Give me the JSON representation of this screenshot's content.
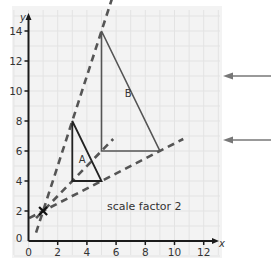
{
  "diagram": {
    "type": "enlargement",
    "caption": "scale factor 2",
    "scale_factor": 2,
    "center_of_enlargement": {
      "x": 1,
      "y": 2,
      "marker": "cross"
    },
    "axes": {
      "x_label": "x",
      "y_label": "y",
      "x_ticks": [
        "0",
        "2",
        "4",
        "6",
        "8",
        "10",
        "12"
      ],
      "y_ticks": [
        "0",
        "2",
        "4",
        "6",
        "8",
        "10",
        "12",
        "14"
      ],
      "x_range": [
        0,
        12
      ],
      "y_range": [
        0,
        14
      ]
    },
    "shapes": [
      {
        "label": "A",
        "vertices": [
          [
            3,
            4
          ],
          [
            3,
            8
          ],
          [
            5,
            4
          ]
        ]
      },
      {
        "label": "B",
        "vertices": [
          [
            5,
            6
          ],
          [
            5,
            14
          ],
          [
            9,
            6
          ]
        ]
      }
    ],
    "rays": [
      {
        "from": [
          1,
          2
        ],
        "through": [
          3,
          8
        ],
        "to": [
          5,
          14
        ]
      },
      {
        "from": [
          1,
          2
        ],
        "through": [
          3,
          4
        ],
        "to": [
          5,
          6
        ]
      },
      {
        "from": [
          1,
          2
        ],
        "through": [
          5,
          4
        ],
        "to": [
          9,
          6
        ]
      }
    ],
    "annotation_arrows": 2,
    "colors": {
      "grid": "#e3e3e3",
      "paper": "#f3f3f3",
      "axis": "#1a1a1a",
      "shape_a": "#222222",
      "shape_b": "#555555",
      "ray": "#555555",
      "arrow": "#777777"
    }
  }
}
